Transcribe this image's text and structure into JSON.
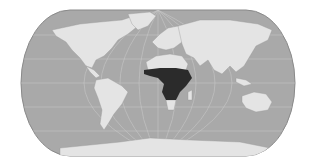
{
  "map": {
    "projection": "Eckert IV (pseudocylindrical)",
    "colors": {
      "background": "#ffffff",
      "ocean": "#a9a9a9",
      "land": "#e4e4e4",
      "highlight": "#2b2b2b",
      "graticule": "#c8c8c8",
      "border": "#8a8a8a"
    },
    "highlighted_region": "Sub-Saharan Africa",
    "legend": [],
    "labels": []
  }
}
